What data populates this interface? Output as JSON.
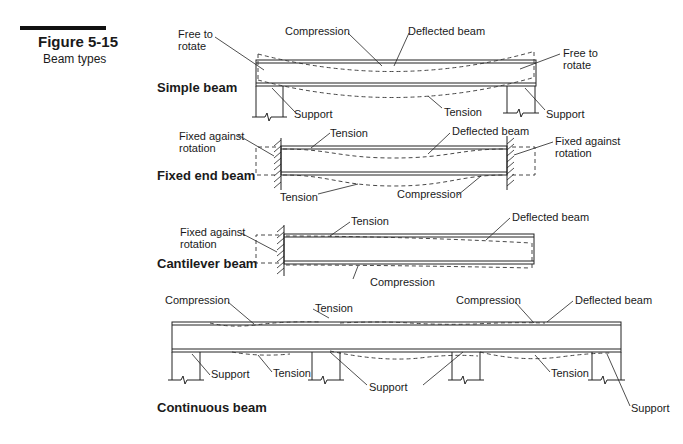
{
  "figure": {
    "number": "Figure 5-15",
    "caption": "Beam types"
  },
  "beams": [
    {
      "title": "Simple beam",
      "labels": {
        "free_left": [
          "Free to",
          "rotate"
        ],
        "compression": "Compression",
        "deflected": "Deflected beam",
        "free_right": [
          "Free to",
          "rotate"
        ],
        "support_left": "Support",
        "tension": "Tension",
        "support_right": "Support"
      }
    },
    {
      "title": "Fixed end beam",
      "labels": {
        "fixed_left": [
          "Fixed against",
          "rotation"
        ],
        "tension_top": "Tension",
        "deflected": "Deflected beam",
        "fixed_right": [
          "Fixed against",
          "rotation"
        ],
        "tension_bottom": "Tension",
        "compression": "Compression"
      }
    },
    {
      "title": "Cantilever beam",
      "labels": {
        "fixed_left": [
          "Fixed against",
          "rotation"
        ],
        "tension": "Tension",
        "deflected": "Deflected beam",
        "compression": "Compression"
      }
    },
    {
      "title": "Continuous beam",
      "labels": {
        "compression_left": "Compression",
        "tension_top": "Tension",
        "compression_right": "Compression",
        "deflected": "Deflected beam",
        "support_1": "Support",
        "tension_1": "Tension",
        "support_mid": "Support",
        "tension_2": "Tension",
        "support_right": "Support"
      }
    }
  ]
}
